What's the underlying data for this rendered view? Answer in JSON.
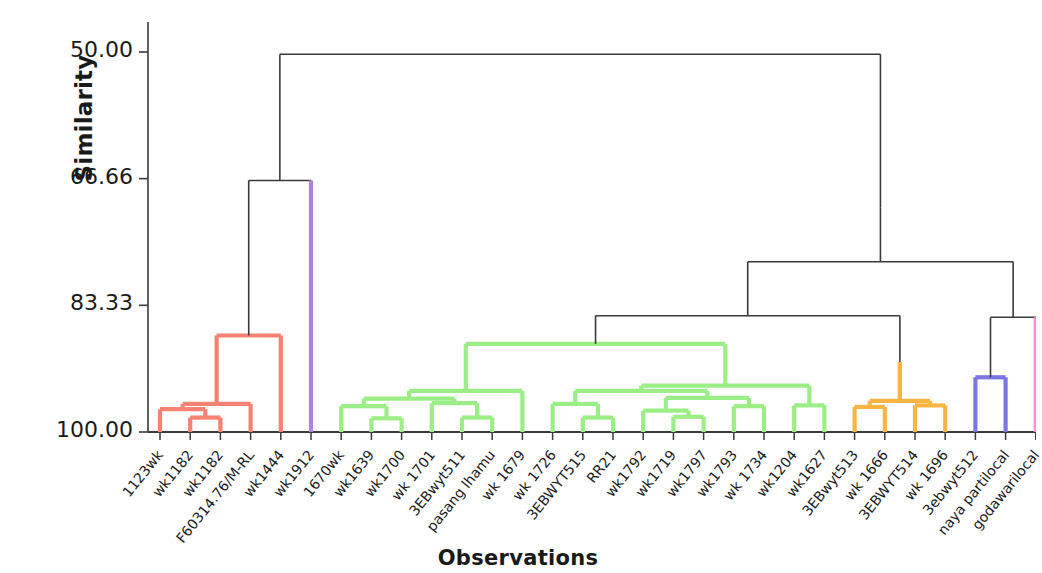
{
  "axes": {
    "ylabel": "Similarity",
    "xlabel": "Observations",
    "yticks": [
      "50.00",
      "66.66",
      "83.33",
      "100.00"
    ],
    "ytick_values": [
      50.0,
      66.66,
      83.33,
      100.0
    ]
  },
  "colors": {
    "red": "#F58273",
    "green": "#9BEE86",
    "orange": "#F9B544",
    "purple": "#B183DD",
    "blue": "#7C76E0",
    "pink": "#F88FD0",
    "black": "#3a3a3a",
    "text": "#1a1a1a"
  },
  "chart_data": {
    "type": "dendrogram",
    "title": "",
    "xlabel": "Observations",
    "ylabel": "Similarity",
    "ylim": [
      50.0,
      100.0
    ],
    "yticks": [
      50.0,
      66.66,
      83.33,
      100.0
    ],
    "y_axis_inverted": true,
    "grid": false,
    "legend": "none",
    "n_leaves": 28,
    "leaves": [
      {
        "index": 0,
        "label": "1123wk",
        "color": "red"
      },
      {
        "index": 1,
        "label": "wk1182",
        "color": "red"
      },
      {
        "index": 2,
        "label": "wk1182",
        "color": "red"
      },
      {
        "index": 3,
        "label": "F60314.76/M-RL",
        "color": "red"
      },
      {
        "index": 4,
        "label": "wk1444",
        "color": "red"
      },
      {
        "index": 5,
        "label": "wk1912",
        "color": "purple"
      },
      {
        "index": 6,
        "label": "1670wk",
        "color": "green"
      },
      {
        "index": 7,
        "label": "wk1639",
        "color": "green"
      },
      {
        "index": 8,
        "label": "wk1700",
        "color": "green"
      },
      {
        "index": 9,
        "label": "wk 1701",
        "color": "green"
      },
      {
        "index": 10,
        "label": "3EBwyt511",
        "color": "green"
      },
      {
        "index": 11,
        "label": "pasang lhamu",
        "color": "green"
      },
      {
        "index": 12,
        "label": "wk 1679",
        "color": "green"
      },
      {
        "index": 13,
        "label": "wk 1726",
        "color": "green"
      },
      {
        "index": 14,
        "label": "3EBWYT515",
        "color": "green"
      },
      {
        "index": 15,
        "label": "RR21",
        "color": "green"
      },
      {
        "index": 16,
        "label": "wk1792",
        "color": "green"
      },
      {
        "index": 17,
        "label": "wk1719",
        "color": "green"
      },
      {
        "index": 18,
        "label": "wk1797",
        "color": "green"
      },
      {
        "index": 19,
        "label": "wk1793",
        "color": "green"
      },
      {
        "index": 20,
        "label": "wk 1734",
        "color": "green"
      },
      {
        "index": 21,
        "label": "wk1204",
        "color": "green"
      },
      {
        "index": 22,
        "label": "wk1627",
        "color": "green"
      },
      {
        "index": 23,
        "label": "3EBwyt513",
        "color": "orange"
      },
      {
        "index": 24,
        "label": "wk 1666",
        "color": "orange"
      },
      {
        "index": 25,
        "label": "3EBWYT514",
        "color": "orange"
      },
      {
        "index": 26,
        "label": "wk 1696",
        "color": "orange"
      },
      {
        "index": 27,
        "label": "3ebwyt512",
        "color": "blue"
      },
      {
        "index": 28,
        "label": "naya partilocal",
        "color": "blue"
      },
      {
        "index": 29,
        "label": "godawarilocal",
        "color": "pink"
      }
    ],
    "merges": [
      {
        "id": "m1",
        "left": {
          "leaf": 1
        },
        "right": {
          "leaf": 2
        },
        "height": 98.1,
        "color": "red"
      },
      {
        "id": "m2",
        "left": {
          "leaf": 0
        },
        "right": {
          "node": "m1"
        },
        "height": 97.0,
        "color": "red"
      },
      {
        "id": "m3",
        "left": {
          "node": "m2"
        },
        "right": {
          "leaf": 3
        },
        "height": 96.3,
        "color": "red"
      },
      {
        "id": "m4",
        "left": {
          "node": "m3"
        },
        "right": {
          "leaf": 4
        },
        "height": 87.3,
        "color": "red"
      },
      {
        "id": "m5",
        "left": {
          "leaf": 7
        },
        "right": {
          "leaf": 8
        },
        "height": 98.2,
        "color": "green"
      },
      {
        "id": "m6",
        "left": {
          "leaf": 6
        },
        "right": {
          "node": "m5"
        },
        "height": 96.6,
        "color": "green"
      },
      {
        "id": "m7",
        "left": {
          "leaf": 10
        },
        "right": {
          "leaf": 11
        },
        "height": 98.1,
        "color": "green"
      },
      {
        "id": "m8",
        "left": {
          "leaf": 9
        },
        "right": {
          "node": "m7"
        },
        "height": 96.2,
        "color": "green"
      },
      {
        "id": "m9",
        "left": {
          "node": "m6"
        },
        "right": {
          "node": "m8"
        },
        "height": 95.6,
        "color": "green"
      },
      {
        "id": "m10",
        "left": {
          "node": "m9"
        },
        "right": {
          "leaf": 12
        },
        "height": 94.6,
        "color": "green"
      },
      {
        "id": "m11",
        "left": {
          "leaf": 14
        },
        "right": {
          "leaf": 15
        },
        "height": 98.1,
        "color": "green"
      },
      {
        "id": "m12",
        "left": {
          "leaf": 13
        },
        "right": {
          "node": "m11"
        },
        "height": 96.3,
        "color": "green"
      },
      {
        "id": "m13",
        "left": {
          "leaf": 17
        },
        "right": {
          "leaf": 18
        },
        "height": 98.0,
        "color": "green"
      },
      {
        "id": "m14",
        "left": {
          "leaf": 16
        },
        "right": {
          "node": "m13"
        },
        "height": 97.2,
        "color": "green"
      },
      {
        "id": "m15",
        "left": {
          "leaf": 19
        },
        "right": {
          "leaf": 20
        },
        "height": 96.6,
        "color": "green"
      },
      {
        "id": "m16",
        "left": {
          "node": "m14"
        },
        "right": {
          "node": "m15"
        },
        "height": 95.5,
        "color": "green"
      },
      {
        "id": "m17",
        "left": {
          "node": "m12"
        },
        "right": {
          "node": "m16"
        },
        "height": 94.6,
        "color": "green"
      },
      {
        "id": "m18",
        "left": {
          "leaf": 21
        },
        "right": {
          "leaf": 22
        },
        "height": 96.5,
        "color": "green"
      },
      {
        "id": "m19",
        "left": {
          "node": "m17"
        },
        "right": {
          "node": "m18"
        },
        "height": 93.9,
        "color": "green"
      },
      {
        "id": "m20",
        "left": {
          "node": "m10"
        },
        "right": {
          "node": "m19"
        },
        "height": 88.4,
        "color": "green"
      },
      {
        "id": "m21",
        "left": {
          "leaf": 23
        },
        "right": {
          "leaf": 24
        },
        "height": 96.7,
        "color": "orange"
      },
      {
        "id": "m22",
        "left": {
          "leaf": 25
        },
        "right": {
          "leaf": 26
        },
        "height": 96.5,
        "color": "orange"
      },
      {
        "id": "m23",
        "left": {
          "node": "m21"
        },
        "right": {
          "node": "m22"
        },
        "height": 95.9,
        "color": "orange"
      },
      {
        "id": "m24",
        "left": {
          "node": "m23"
        },
        "right": null,
        "height": 90.8,
        "color": "orange"
      },
      {
        "id": "m25",
        "left": {
          "leaf": 27
        },
        "right": {
          "leaf": 28
        },
        "height": 92.8,
        "color": "blue"
      },
      {
        "id": "m26",
        "left": {
          "node": "m20"
        },
        "right": {
          "node": "m24"
        },
        "height": 84.7,
        "color": "black"
      },
      {
        "id": "m27",
        "left": {
          "node": "m25"
        },
        "right": {
          "leaf": 29
        },
        "height": 84.9,
        "color": "black"
      },
      {
        "id": "m28",
        "left": {
          "node": "m26"
        },
        "right": {
          "node": "m27"
        },
        "height": 77.6,
        "color": "black"
      },
      {
        "id": "m29",
        "left": {
          "node": "m28"
        },
        "right": null,
        "height": 70.5,
        "color": "black"
      },
      {
        "id": "m30",
        "left": {
          "node": "m4"
        },
        "right": {
          "leaf": 5
        },
        "height": 66.9,
        "color": "black"
      },
      {
        "id": "m31",
        "left": {
          "node": "m30"
        },
        "right": {
          "node": "m29"
        },
        "height": 50.3,
        "color": "black"
      }
    ]
  }
}
